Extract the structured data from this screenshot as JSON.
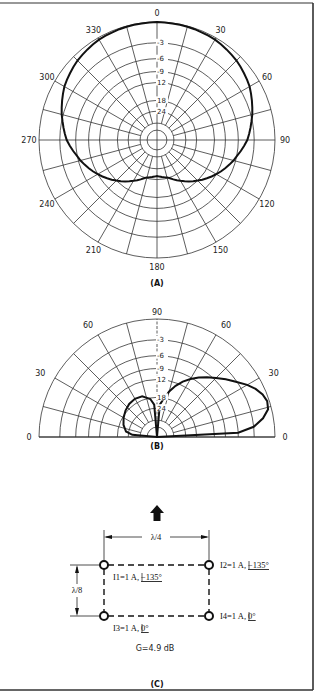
{
  "figure": {
    "frame": {
      "top_y": 3,
      "bottom_y": 690,
      "right_x": 313
    },
    "panels": {
      "A": {
        "caption": "(A)"
      },
      "B": {
        "caption": "(B)"
      },
      "C": {
        "caption": "(C)"
      }
    }
  },
  "chart_data": [
    {
      "type": "polar",
      "panel": "A",
      "title": "Azimuth pattern",
      "caption": "(A)",
      "angle_ticks_deg": [
        0,
        30,
        60,
        90,
        120,
        150,
        180,
        210,
        240,
        270,
        300,
        330
      ],
      "angle_labels": [
        "0",
        "30",
        "60",
        "90",
        "120",
        "150",
        "180",
        "210",
        "240",
        "270",
        "300",
        "330"
      ],
      "ring_labels_db": [
        "-3",
        "-6",
        "-9",
        "12",
        "18",
        "24"
      ],
      "ring_values_db": [
        0,
        -3,
        -6,
        -9,
        -12,
        -18,
        -24
      ],
      "spoke_step_deg": 15,
      "grid": true,
      "series": [
        {
          "name": "azimuth response",
          "unit": "dB",
          "angles_deg": [
            0,
            15,
            30,
            45,
            60,
            75,
            90,
            105,
            120,
            135,
            150,
            165,
            180,
            195,
            210,
            225,
            240,
            255,
            270,
            285,
            300,
            315,
            330,
            345
          ],
          "values_db": [
            0,
            -0.1,
            -0.3,
            -0.8,
            -1.6,
            -2.8,
            -4.3,
            -6.5,
            -9.0,
            -12.0,
            -15.5,
            -18.5,
            -20.0,
            -18.5,
            -15.5,
            -12.0,
            -9.0,
            -6.5,
            -4.3,
            -2.8,
            -1.6,
            -0.8,
            -0.3,
            -0.1
          ]
        }
      ]
    },
    {
      "type": "polar",
      "panel": "B",
      "title": "Elevation pattern",
      "caption": "(B)",
      "angle_labels_left": [
        "0",
        "30",
        "60"
      ],
      "angle_labels_right": [
        "0",
        "30",
        "60"
      ],
      "angle_label_top": "90",
      "ring_labels_db": [
        "-3",
        "-6",
        "-9",
        "12",
        "18",
        "24"
      ],
      "ring_values_db": [
        0,
        -3,
        -6,
        -9,
        -12,
        -18,
        -24
      ],
      "spoke_step_deg": 15,
      "grid": true,
      "series": [
        {
          "name": "forward lobe",
          "unit": "dB",
          "elevation_deg": [
            0,
            3,
            6,
            10,
            14,
            18,
            22,
            26,
            30,
            35,
            40,
            45,
            50,
            55,
            60,
            65,
            70,
            75,
            80,
            85,
            90
          ],
          "values_db": [
            -40,
            -6,
            -3,
            -1.5,
            -0.5,
            -0.3,
            -0.6,
            -1.2,
            -2.0,
            -3.2,
            -4.4,
            -5.6,
            -6.8,
            -8.0,
            -9.4,
            -11,
            -13,
            -15.5,
            -18.5,
            -22,
            -40
          ]
        },
        {
          "name": "back lobe",
          "unit": "dB",
          "elevation_deg": [
            90,
            95,
            100,
            110,
            120,
            130,
            140,
            150,
            160,
            170,
            175,
            180
          ],
          "values_db": [
            -40,
            -22,
            -18.6,
            -16.8,
            -16.5,
            -16.8,
            -17.5,
            -18.6,
            -20.2,
            -22.5,
            -26,
            -40
          ]
        }
      ]
    }
  ],
  "array_diagram": {
    "direction_arrow": "up-arrow",
    "width_label": "λ/4",
    "height_label": "λ/8",
    "elements": [
      {
        "id": "I1",
        "label": "I1=1 A,",
        "phase": "−135°",
        "position": "top-left"
      },
      {
        "id": "I2",
        "label": "I2=1 A,",
        "phase": "−135°",
        "position": "top-right"
      },
      {
        "id": "I3",
        "label": "I3=1 A,",
        "phase": "0°",
        "position": "bottom-left"
      },
      {
        "id": "I4",
        "label": "I4=1 A,",
        "phase": "0°",
        "position": "bottom-right"
      }
    ],
    "gain_label": "G=4.9 dB"
  },
  "colors": {
    "ink": "#111111",
    "grid": "#333333",
    "background": "#ffffff"
  }
}
